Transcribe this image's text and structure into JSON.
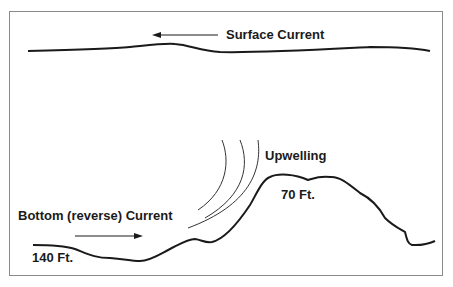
{
  "diagram": {
    "labels": {
      "surface_current": "Surface Current",
      "upwelling": "Upwelling",
      "bottom_current": "Bottom (reverse) Current",
      "depth_shallow": "70 Ft.",
      "depth_deep": "140 Ft."
    },
    "colors": {
      "line": "#1a1a1a",
      "border": "#8a8a8a",
      "background": "#ffffff"
    }
  }
}
